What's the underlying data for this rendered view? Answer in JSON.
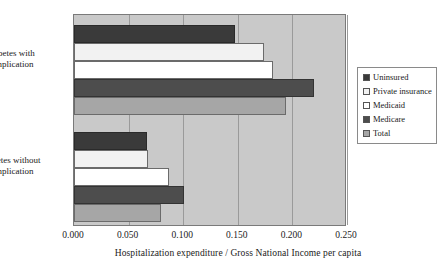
{
  "chart_data": {
    "type": "bar",
    "orientation": "horizontal",
    "title": "",
    "xlabel": "Hospitalization expenditure / Gross National Income per capita",
    "ylabel": "",
    "categories": [
      "Diabetes with complication",
      "Diabetes without complication"
    ],
    "category_lines": [
      [
        "Diabetes with",
        "complication"
      ],
      [
        "Diabetes without",
        "complication"
      ]
    ],
    "series": [
      {
        "name": "Uninsured",
        "color": "#3a3a3a",
        "values": [
          0.147,
          0.067
        ]
      },
      {
        "name": "Private insurance",
        "color": "#f2f2f2",
        "values": [
          0.174,
          0.068
        ]
      },
      {
        "name": "Medicaid",
        "color": "#ffffff",
        "values": [
          0.182,
          0.087
        ]
      },
      {
        "name": "Medicare",
        "color": "#4d4d4d",
        "values": [
          0.22,
          0.101
        ]
      },
      {
        "name": "Total",
        "color": "#a6a6a6",
        "values": [
          0.194,
          0.08
        ]
      }
    ],
    "xlim": [
      0.0,
      0.25
    ],
    "xticks": [
      0.0,
      0.05,
      0.1,
      0.15,
      0.2,
      0.25
    ],
    "xtick_labels": [
      "0.000",
      "0.050",
      "0.100",
      "0.150",
      "0.200",
      "0.250"
    ],
    "grid": true,
    "grid_axis": "x",
    "legend_position": "right",
    "plot_background": "#c9c9c9",
    "figure_background": "#ffffff"
  }
}
